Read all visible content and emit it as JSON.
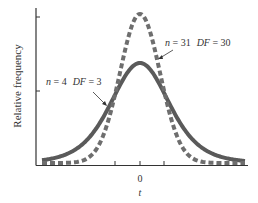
{
  "chart_data": {
    "type": "line",
    "title": "",
    "xlabel": "t",
    "ylabel": "Relative frequency",
    "x_ticks": [
      "",
      "0",
      ""
    ],
    "y_ticks": [
      "",
      ""
    ],
    "grid": false,
    "legend": "annotations",
    "series": [
      {
        "name": "n = 4  DF = 3",
        "style": "solid",
        "df": 3,
        "n": 4
      },
      {
        "name": "n = 31  DF = 30",
        "style": "dashed",
        "df": 30,
        "n": 31
      }
    ],
    "annotations": [
      {
        "text": "n = 31   DF = 30",
        "target_series": "dashed"
      },
      {
        "text": "n = 4   DF = 3",
        "target_series": "solid"
      }
    ],
    "colors": {
      "solid": "#5a5a5a",
      "dashed": "#6e6e6e",
      "axis": "#333333"
    }
  },
  "labels": {
    "ylabel": "Relative frequency",
    "xlabel": "t",
    "x_zero": "0",
    "ann_dashed_n": "n",
    "ann_dashed_rest": " = 31",
    "ann_dashed_df": "DF",
    "ann_dashed_df_val": " = 30",
    "ann_solid_n": "n",
    "ann_solid_rest": " = 4",
    "ann_solid_df": "DF",
    "ann_solid_df_val": " = 3"
  }
}
